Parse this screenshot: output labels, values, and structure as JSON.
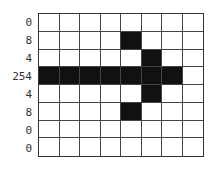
{
  "diagram": {
    "type": "bitmap-grid",
    "rows": 8,
    "cols": 8,
    "row_values": [
      "0",
      "8",
      "4",
      "254",
      "4",
      "8",
      "0",
      "0"
    ],
    "bits": [
      [
        0,
        0,
        0,
        0,
        0,
        0,
        0,
        0
      ],
      [
        0,
        0,
        0,
        0,
        1,
        0,
        0,
        0
      ],
      [
        0,
        0,
        0,
        0,
        0,
        1,
        0,
        0
      ],
      [
        1,
        1,
        1,
        1,
        1,
        1,
        1,
        0
      ],
      [
        0,
        0,
        0,
        0,
        0,
        1,
        0,
        0
      ],
      [
        0,
        0,
        0,
        0,
        1,
        0,
        0,
        0
      ],
      [
        0,
        0,
        0,
        0,
        0,
        0,
        0,
        0
      ],
      [
        0,
        0,
        0,
        0,
        0,
        0,
        0,
        0
      ]
    ],
    "colors": {
      "on": "#111111",
      "off": "#ffffff",
      "grid": "#444444"
    }
  }
}
